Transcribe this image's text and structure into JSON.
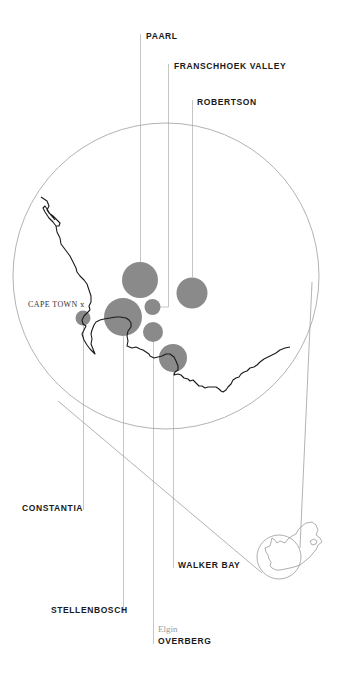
{
  "map": {
    "city": {
      "name": "CAPE TOWN",
      "marker": "ⅹ",
      "icon": "city-marker-icon"
    },
    "regions": [
      {
        "id": "paarl",
        "label": "PAARL"
      },
      {
        "id": "franschhoek",
        "label": "FRANSCHHOEK VALLEY"
      },
      {
        "id": "robertson",
        "label": "ROBERTSON"
      },
      {
        "id": "constantia",
        "label": "CONSTANTIA"
      },
      {
        "id": "walker-bay",
        "label": "WALKER BAY"
      },
      {
        "id": "stellenbosch",
        "label": "STELLENBOSCH"
      },
      {
        "id": "overberg",
        "label": "OVERBERG",
        "sublabel": "Elgin"
      }
    ],
    "colors": {
      "bubble": "#8a8a8a",
      "leader_line": "#b5b5b5",
      "coastline": "#1a1a1a",
      "circle_outline": "#9a9a9a",
      "label_text": "#1a1a1a",
      "sublabel_text": "#9a9a9a"
    },
    "inset": {
      "description": "South Africa locator outline"
    }
  }
}
